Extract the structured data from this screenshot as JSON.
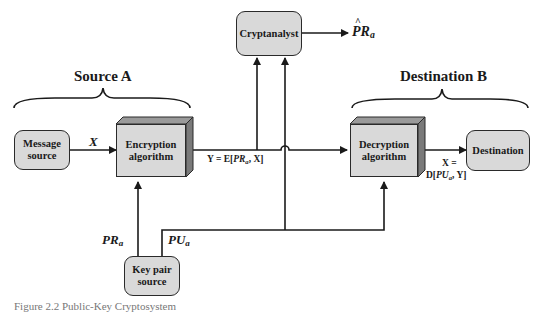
{
  "diagram": {
    "headings": {
      "source": "Source A",
      "destination": "Destination B"
    },
    "nodes": {
      "message_source": "Message source",
      "encryption": "Encryption algorithm",
      "cryptanalyst": "Cryptanalyst",
      "decryption": "Decryption algorithm",
      "destination": "Destination",
      "key_pair_source": "Key pair source"
    },
    "labels": {
      "x": "X",
      "pr_main": "PR",
      "pr_sub": "a",
      "pu_main": "PU",
      "pu_sub": "a",
      "estimate_main": "PR",
      "estimate_sub": "a",
      "ciphertext_eq_pre": "Y = E[",
      "ciphertext_eq_key": "PR",
      "ciphertext_eq_sub": "a",
      "ciphertext_eq_post": ", X]",
      "plaintext_eq_line1": "X =",
      "plaintext_eq_pre": "D[",
      "plaintext_eq_key": "PU",
      "plaintext_eq_sub": "a",
      "plaintext_eq_post": ", Y]"
    },
    "caption": "Figure 2.2  Public-Key Cryptosystem"
  }
}
